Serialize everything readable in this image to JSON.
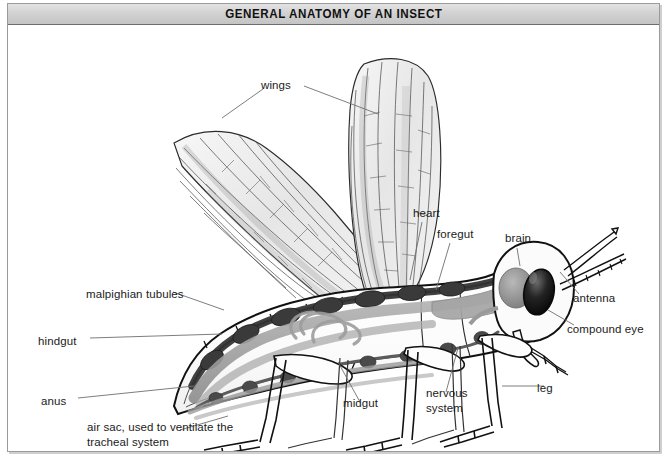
{
  "title": "GENERAL ANATOMY OF AN INSECT",
  "figure": {
    "subject": "insect",
    "view": "lateral cutaway",
    "style": "line drawing with grayscale shading"
  },
  "colors": {
    "frame": "#9b9b9b",
    "titlebar_top": "#e3e3e3",
    "titlebar_bottom": "#c4c4c4",
    "title_text": "#111111",
    "label_text": "#1b1b1b",
    "leader_line": "#6f6f6f",
    "outline": "#111111",
    "heart_dark": "#4a4a4a",
    "gut_gray": "#9a9a9a",
    "wing_shade": "#e9e9e9",
    "eye_dark": "#141414"
  },
  "labels": [
    {
      "id": "wings",
      "text": "wings",
      "x": 261,
      "y": 78
    },
    {
      "id": "heart",
      "text": "heart",
      "x": 413,
      "y": 206
    },
    {
      "id": "foregut",
      "text": "foregut",
      "x": 437,
      "y": 227
    },
    {
      "id": "brain",
      "text": "brain",
      "x": 505,
      "y": 231
    },
    {
      "id": "antenna",
      "text": "antenna",
      "x": 573,
      "y": 291
    },
    {
      "id": "compound-eye",
      "text": "compound eye",
      "x": 567,
      "y": 322
    },
    {
      "id": "malpighian-tubules",
      "text": "malpighian tubules",
      "x": 86,
      "y": 287
    },
    {
      "id": "hindgut",
      "text": "hindgut",
      "x": 38,
      "y": 334
    },
    {
      "id": "anus",
      "text": "anus",
      "x": 41,
      "y": 394
    },
    {
      "id": "air-sac",
      "text": "air sac, used to ventilate the tracheal system",
      "x": 87,
      "y": 420
    },
    {
      "id": "midgut",
      "text": "midgut",
      "x": 343,
      "y": 396
    },
    {
      "id": "nervous-system",
      "text": "nervous system",
      "x": 426,
      "y": 386
    },
    {
      "id": "leg",
      "text": "leg",
      "x": 537,
      "y": 381
    }
  ],
  "anatomy_parts": [
    "wings",
    "heart",
    "foregut",
    "brain",
    "antenna",
    "compound eye",
    "malpighian tubules",
    "hindgut",
    "anus",
    "air sac",
    "midgut",
    "nervous system",
    "leg"
  ]
}
